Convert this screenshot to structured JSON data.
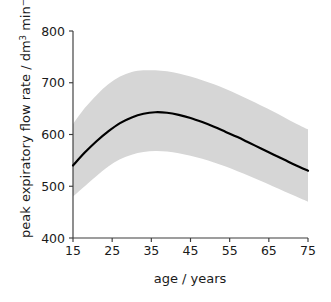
{
  "chart_data": {
    "type": "line",
    "title": "",
    "xlabel": "age / years",
    "ylabel": "peak expiratory flow rate / dm3 min-1",
    "ylabel_parts": {
      "prefix": "peak expiratory flow rate / dm",
      "sup1": "3",
      "mid": " min",
      "sup2": "−1"
    },
    "xlim": [
      15,
      75
    ],
    "ylim": [
      400,
      800
    ],
    "xticks": [
      15,
      25,
      35,
      45,
      55,
      65,
      75
    ],
    "yticks": [
      400,
      500,
      600,
      700,
      800
    ],
    "xtick_labels": [
      "15",
      "25",
      "35",
      "45",
      "55",
      "65",
      "75"
    ],
    "ytick_labels": [
      "400",
      "500",
      "600",
      "700",
      "800"
    ],
    "grid": false,
    "legend": null,
    "series": [
      {
        "name": "mean peak expiratory flow rate",
        "style": "solid-black-line",
        "color": "#000000",
        "x": [
          15,
          18,
          21,
          24,
          27,
          30,
          33,
          36,
          39,
          42,
          45,
          48,
          51,
          54,
          57,
          60,
          63,
          66,
          69,
          72,
          75
        ],
        "values": [
          540,
          565,
          587,
          606,
          622,
          633,
          640,
          643,
          642,
          638,
          632,
          624,
          615,
          605,
          595,
          584,
          573,
          562,
          551,
          540,
          530
        ]
      },
      {
        "name": "confidence band upper bound",
        "style": "shaded-region-upper",
        "color": "#d6d6d6",
        "x": [
          15,
          18,
          21,
          24,
          27,
          30,
          33,
          36,
          39,
          42,
          45,
          48,
          51,
          54,
          57,
          60,
          63,
          66,
          69,
          72,
          75
        ],
        "values": [
          620,
          651,
          676,
          697,
          712,
          721,
          724,
          724,
          722,
          718,
          712,
          705,
          697,
          688,
          678,
          667,
          656,
          645,
          633,
          621,
          610
        ]
      },
      {
        "name": "confidence band lower bound",
        "style": "shaded-region-lower",
        "color": "#d6d6d6",
        "x": [
          15,
          18,
          21,
          24,
          27,
          30,
          33,
          36,
          39,
          42,
          45,
          48,
          51,
          54,
          57,
          60,
          63,
          66,
          69,
          72,
          75
        ],
        "values": [
          480,
          500,
          520,
          538,
          552,
          561,
          566,
          568,
          567,
          564,
          559,
          553,
          546,
          538,
          529,
          520,
          510,
          500,
          490,
          480,
          470
        ]
      }
    ],
    "annotations": []
  },
  "axes": {
    "x_axis_name": "x-axis",
    "y_axis_name": "y-axis",
    "band_name": "confidence-band",
    "curve_name": "mean-curve"
  }
}
